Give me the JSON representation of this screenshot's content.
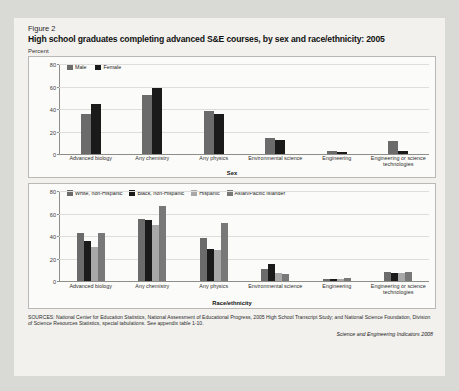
{
  "figure": {
    "number": "Figure 2",
    "title": "High school graduates completing advanced S&E courses, by sex and race/ethnicity: 2005",
    "unit_label": "Percent"
  },
  "source_note": "SOURCES: National Center for Education Statistics, National Assessment of Educational Progress, 2005 High School Transcript Study; and National Science Foundation, Division of Science Resources Statistics, special tabulations. See appendix table 1-10.",
  "attribution": "Science and Engineering Indicators 2008",
  "colors": {
    "male": "#6b6b6b",
    "female": "#1a1a1a",
    "white": "#6b6b6b",
    "black": "#1a1a1a",
    "hispanic": "#a8a8a8",
    "asian": "#787878",
    "grid": "#dedddb",
    "axis": "#8e8d8a",
    "panel_bg": "#fbfbf9",
    "page_bg": "#f2f1ee"
  },
  "chart_data": [
    {
      "type": "bar",
      "title": "High school graduates completing advanced S&E courses, by sex: 2005",
      "xlabel": "Sex",
      "ylabel": "Percent",
      "ylim": [
        0,
        80
      ],
      "yticks": [
        0,
        20,
        40,
        60,
        80
      ],
      "grid": true,
      "legend_position": "top-left",
      "categories": [
        "Advanced biology",
        "Any chemistry",
        "Any physics",
        "Environmental science",
        "Engineering",
        "Engineering or science technologies"
      ],
      "series": [
        {
          "name": "Male",
          "values": [
            36,
            53,
            39,
            14,
            3,
            12
          ]
        },
        {
          "name": "Female",
          "values": [
            45,
            59,
            36,
            13,
            2,
            3
          ]
        }
      ]
    },
    {
      "type": "bar",
      "title": "High school graduates completing advanced S&E courses, by race/ethnicity: 2005",
      "xlabel": "Race/ethnicity",
      "ylabel": "Percent",
      "ylim": [
        0,
        80
      ],
      "yticks": [
        0,
        20,
        40,
        60,
        80
      ],
      "grid": true,
      "legend_position": "top-left",
      "categories": [
        "Advanced biology",
        "Any chemistry",
        "Any physics",
        "Environmental science",
        "Engineering",
        "Engineering or science technologies"
      ],
      "series": [
        {
          "name": "White, non-Hispanic",
          "values": [
            43,
            56,
            39,
            11,
            2,
            8
          ]
        },
        {
          "name": "Black, non-Hispanic",
          "values": [
            36,
            55,
            29,
            15,
            2,
            7
          ]
        },
        {
          "name": "Hispanic",
          "values": [
            31,
            50,
            28,
            7,
            2,
            7
          ]
        },
        {
          "name": "Asian/Pacific Islander",
          "values": [
            43,
            67,
            52,
            6,
            3,
            8
          ]
        }
      ]
    }
  ]
}
